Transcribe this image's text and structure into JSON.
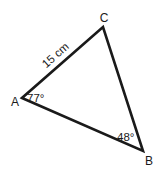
{
  "diagram": {
    "type": "triangle",
    "stroke_color": "#1a1a1a",
    "background": "#ffffff",
    "vertices": {
      "A": {
        "label": "A",
        "x": 22,
        "y": 98
      },
      "B": {
        "label": "B",
        "x": 143,
        "y": 151
      },
      "C": {
        "label": "C",
        "x": 103,
        "y": 27
      }
    },
    "side_labels": {
      "AC": "15 cm"
    },
    "angle_labels": {
      "A": "77°",
      "B": "48°"
    }
  }
}
